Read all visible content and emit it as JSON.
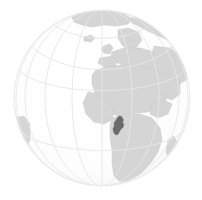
{
  "figure": {
    "kind": "locator-globe-map",
    "projection": "orthographic",
    "title": "Location of Cameroon on the globe",
    "caption": "Cameroon shown in dark grey on a grey globe centred over Africa",
    "width_px": 202,
    "height_px": 200,
    "background_color": "#ffffff"
  },
  "globe": {
    "center_x": 102,
    "center_y": 98,
    "radius": 88,
    "ocean_color": "#ffffff",
    "ocean_edge_color": "#f2f2f2",
    "land_color": "#d5d5d5",
    "land_outline_color": "#c9c9c9",
    "graticule_color": "#e6e6e6",
    "graticule_width": 0.9,
    "outline_color": "#ededed"
  },
  "graticule": {
    "label": "latitude and longitude grid",
    "meridian_spacing_deg": 20,
    "parallel_spacing_deg": 20,
    "meridian_count": 9,
    "parallel_count": 8
  },
  "highlight": {
    "country_name": "Cameroon",
    "color": "#6b6b6b",
    "outline_color": "#5a5a5a",
    "center_x": 119,
    "center_y": 126,
    "approx_lat": 6,
    "approx_lon": 12
  },
  "landmasses": [
    {
      "name": "Africa"
    },
    {
      "name": "Europe"
    },
    {
      "name": "Greenland"
    },
    {
      "name": "Arabia"
    },
    {
      "name": "Western Asia"
    },
    {
      "name": "Madagascar"
    },
    {
      "name": "South America (edge)"
    },
    {
      "name": "Iceland"
    },
    {
      "name": "British Isles"
    }
  ],
  "chart_data": {
    "type": "map",
    "title": "Location of Cameroon on the globe",
    "xlabel": "",
    "ylabel": "",
    "projection": "orthographic",
    "highlighted_regions": [
      "Cameroon"
    ],
    "values": [
      1
    ],
    "categories": [
      "Cameroon"
    ],
    "legend_position": "none",
    "grid": true
  }
}
